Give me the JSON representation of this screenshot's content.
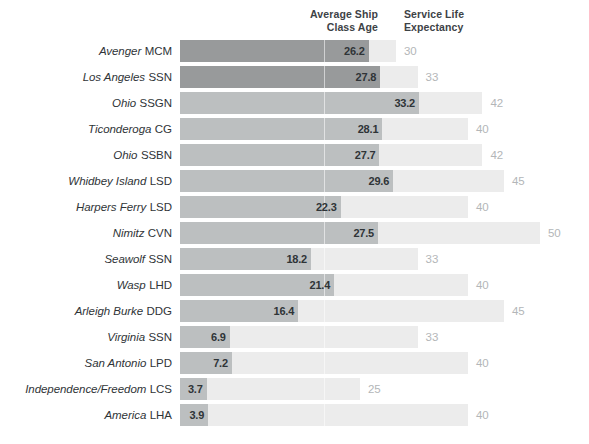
{
  "header": {
    "col_avg_line1": "Average Ship",
    "col_avg_line2": "Class Age",
    "col_svc_line1": "Service Life",
    "col_svc_line2": "Expectancy"
  },
  "colors": {
    "bar_dark": "#989a9b",
    "bar_mid": "#bcbfc0",
    "bar_track": "#ececec",
    "value_text": "#2f3437",
    "expectancy_text": "#b3b6b8",
    "label_text": "#2f3437",
    "background": "#ffffff"
  },
  "chart_data": {
    "type": "bar",
    "title": "",
    "xlabel": "",
    "ylabel": "",
    "xlim": [
      0,
      50
    ],
    "grid": false,
    "orientation": "horizontal",
    "legend_position": "top",
    "series": [
      {
        "name": "Average Ship Class Age",
        "values": [
          26.2,
          27.8,
          33.2,
          28.1,
          27.7,
          29.6,
          22.3,
          27.5,
          18.2,
          21.4,
          16.4,
          6.9,
          7.2,
          3.7,
          3.9
        ]
      },
      {
        "name": "Service Life Expectancy",
        "values": [
          30,
          33,
          42,
          40,
          42,
          45,
          40,
          50,
          33,
          40,
          45,
          33,
          40,
          25,
          40
        ]
      }
    ],
    "categories": [
      "Avenger MCM",
      "Los Angeles SSN",
      "Ohio SSGN",
      "Ticonderoga CG",
      "Ohio SSBN",
      "Whidbey Island LSD",
      "Harpers Ferry LSD",
      "Nimitz CVN",
      "Seawolf SSN",
      "Wasp LHD",
      "Arleigh Burke DDG",
      "Virginia SSN",
      "San Antonio LPD",
      "Independence/Freedom LCS",
      "America LHA"
    ]
  },
  "rows": [
    {
      "class": "Avenger",
      "hull": "MCM",
      "age": "26.2",
      "age_value": 26.2,
      "expectancy": "30",
      "expectancy_value": 30,
      "shade": "dark"
    },
    {
      "class": "Los Angeles",
      "hull": "SSN",
      "age": "27.8",
      "age_value": 27.8,
      "expectancy": "33",
      "expectancy_value": 33,
      "shade": "dark"
    },
    {
      "class": "Ohio",
      "hull": "SSGN",
      "age": "33.2",
      "age_value": 33.2,
      "expectancy": "42",
      "expectancy_value": 42,
      "shade": "mid"
    },
    {
      "class": "Ticonderoga",
      "hull": "CG",
      "age": "28.1",
      "age_value": 28.1,
      "expectancy": "40",
      "expectancy_value": 40,
      "shade": "mid"
    },
    {
      "class": "Ohio",
      "hull": "SSBN",
      "age": "27.7",
      "age_value": 27.7,
      "expectancy": "42",
      "expectancy_value": 42,
      "shade": "mid"
    },
    {
      "class": "Whidbey Island",
      "hull": "LSD",
      "age": "29.6",
      "age_value": 29.6,
      "expectancy": "45",
      "expectancy_value": 45,
      "shade": "mid"
    },
    {
      "class": "Harpers Ferry",
      "hull": "LSD",
      "age": "22.3",
      "age_value": 22.3,
      "expectancy": "40",
      "expectancy_value": 40,
      "shade": "mid"
    },
    {
      "class": "Nimitz",
      "hull": "CVN",
      "age": "27.5",
      "age_value": 27.5,
      "expectancy": "50",
      "expectancy_value": 50,
      "shade": "mid"
    },
    {
      "class": "Seawolf",
      "hull": "SSN",
      "age": "18.2",
      "age_value": 18.2,
      "expectancy": "33",
      "expectancy_value": 33,
      "shade": "mid"
    },
    {
      "class": "Wasp",
      "hull": "LHD",
      "age": "21.4",
      "age_value": 21.4,
      "expectancy": "40",
      "expectancy_value": 40,
      "shade": "mid"
    },
    {
      "class": "Arleigh Burke",
      "hull": "DDG",
      "age": "16.4",
      "age_value": 16.4,
      "expectancy": "45",
      "expectancy_value": 45,
      "shade": "mid"
    },
    {
      "class": "Virginia",
      "hull": "SSN",
      "age": "6.9",
      "age_value": 6.9,
      "expectancy": "33",
      "expectancy_value": 33,
      "shade": "mid"
    },
    {
      "class": "San Antonio",
      "hull": "LPD",
      "age": "7.2",
      "age_value": 7.2,
      "expectancy": "40",
      "expectancy_value": 40,
      "shade": "mid"
    },
    {
      "class": "Independence/Freedom",
      "hull": "LCS",
      "age": "3.7",
      "age_value": 3.7,
      "expectancy": "25",
      "expectancy_value": 25,
      "shade": "mid"
    },
    {
      "class": "America",
      "hull": "LHA",
      "age": "3.9",
      "age_value": 3.9,
      "expectancy": "40",
      "expectancy_value": 40,
      "shade": "mid"
    }
  ]
}
